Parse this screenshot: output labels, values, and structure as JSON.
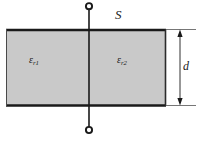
{
  "figure": {
    "type": "diagram",
    "labels": {
      "area_symbol": "S",
      "dielectric_left_symbol": "ε",
      "dielectric_left_subscript": "r1",
      "dielectric_right_symbol": "ε",
      "dielectric_right_subscript": "r2",
      "thickness_symbol": "d"
    },
    "colors": {
      "dielectric_fill": "#c9c9c9",
      "plate_stroke": "#1a1a1a",
      "line_stroke": "#1a1a1a",
      "thin_stroke": "#555555",
      "background": "#ffffff"
    },
    "geometry": {
      "body_left": 6,
      "body_right": 166,
      "body_top": 29,
      "body_bottom": 106,
      "divider_x": 89,
      "terminal_top_y": 6,
      "terminal_bottom_y": 130,
      "terminal_radius": 3,
      "dimension_line_x": 180,
      "extension_line_right": 196
    }
  }
}
